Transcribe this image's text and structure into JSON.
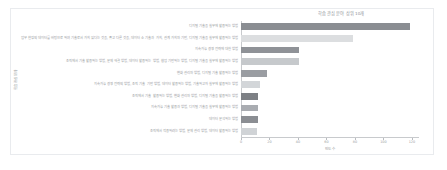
{
  "chart_data": {
    "type": "bar",
    "orientation": "horizontal",
    "title": "학습 관심 분야 상위 10개",
    "xlabel": "빈도 수",
    "ylabel": "학습 관심 분야",
    "xlim": [
      0,
      125
    ],
    "xticks": [
      0,
      20,
      40,
      60,
      80,
      100,
      120
    ],
    "xtick_labels": [
      "0",
      "20",
      "40",
      "60",
      "80",
      "100",
      "120"
    ],
    "grid": false,
    "legend": "none",
    "categories": [
      "디지털 기술을 실무에 활용하는 방법",
      "업무 현장의 데이터를 바탕으로 하여 기술로서 가치 있다는 것을, 좋고 다른 것을, 데이터 소 기술과 가치, 관계 가치와 기반, 디지털 기술을 실무에 활용하는 방법",
      "지속가능 경영 전략에 대한 방법",
      "조직에서 기술 활용하는 방법, 문제 해결 방법, 데이터 활용하는 방법, 협업 기반하는 방법, 디지털 기술을 실무에 활용하는 방법",
      "변화 관리와 방법, 디지털 기술 활용하는 방법",
      "지속가능 경영 전략의 방법, 조직 기술 기반 방법, 데이터 활용하는 방법, 기술하고자 실무에 활용하는 방법",
      "조직에서 기술 활용하는 방법, 변화 관리와 방법, 디지털 기술을 활용하는 방법",
      "지속가능 기술 활용과 방법, 디지털 기술을 실무에 활용하는 방법",
      "데이터 분석하는 방법",
      "조직에서 적용하려는 방법, 문제 관리 방법, 데이터 활용하는 방법"
    ],
    "values": [
      119,
      79,
      41,
      41,
      18,
      13,
      12,
      12,
      12,
      11
    ],
    "bar_colors": [
      "#8a8d92",
      "#dcdee0",
      "#8f9297",
      "#c6c9cc",
      "#9a9da2",
      "#d3d6d9",
      "#7d8085",
      "#a9acb1",
      "#8b8e93",
      "#d0d3d6"
    ]
  }
}
